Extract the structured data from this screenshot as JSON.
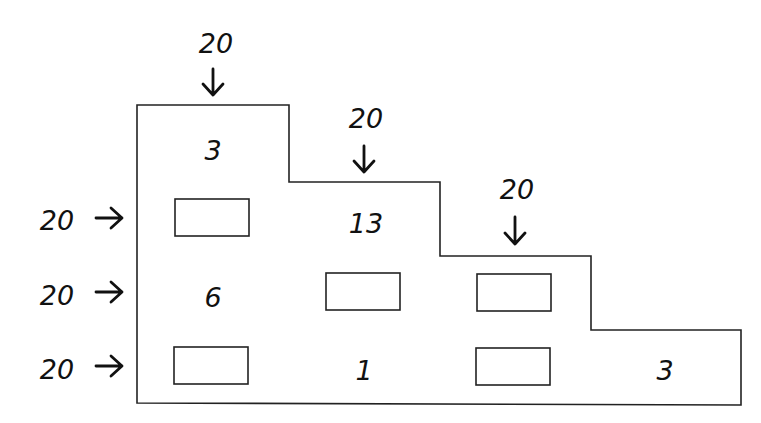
{
  "puzzle": {
    "column_sums": [
      {
        "label": "20",
        "icon": "arrow-down-icon"
      },
      {
        "label": "20",
        "icon": "arrow-down-icon"
      },
      {
        "label": "20",
        "icon": "arrow-down-icon"
      }
    ],
    "row_sums": [
      {
        "label": "20",
        "icon": "arrow-right-icon"
      },
      {
        "label": "20",
        "icon": "arrow-right-icon"
      },
      {
        "label": "20",
        "icon": "arrow-right-icon"
      }
    ],
    "cells": {
      "r0c0": "3",
      "r1c1": "13",
      "r2c0": "6",
      "r3c1": "1",
      "r3c3": "3"
    },
    "blank_boxes": [
      {
        "row": 1,
        "col": 0,
        "value": ""
      },
      {
        "row": 2,
        "col": 1,
        "value": ""
      },
      {
        "row": 2,
        "col": 2,
        "value": ""
      },
      {
        "row": 3,
        "col": 0,
        "value": ""
      },
      {
        "row": 3,
        "col": 2,
        "value": ""
      }
    ]
  }
}
